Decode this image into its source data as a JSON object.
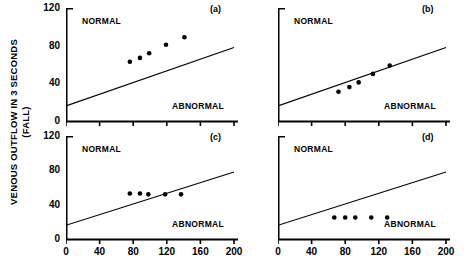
{
  "chart_data": {
    "type": "scatter",
    "title": "",
    "xlabel": "",
    "ylabel": "VENOUS OUTFLOW IN 3 SECONDS (FALL)",
    "ylabel_line1": "VENOUS OUTFLOW IN 3 SECONDS",
    "ylabel_line2": "(FALL)",
    "xlim": [
      0,
      200
    ],
    "ylim": [
      0,
      120
    ],
    "xticks": [
      0,
      40,
      80,
      120,
      160,
      200
    ],
    "yticks": [
      0,
      40,
      80,
      120
    ],
    "xtick_labels": [
      "0",
      "40",
      "80",
      "120",
      "160",
      "200"
    ],
    "ytick_labels": [
      "0",
      "40",
      "80",
      "120"
    ],
    "grid": false,
    "legend": "none",
    "zone_upper_label": "NORMAL",
    "zone_lower_label": "ABNORMAL",
    "reference_line": {
      "x": [
        0,
        200
      ],
      "y": [
        16,
        78
      ],
      "description": "diagonal boundary separating NORMAL from ABNORMAL"
    },
    "panels": [
      {
        "tag": "(a)",
        "zone_upper": "NORMAL",
        "zone_lower": "ABNORMAL",
        "x": [
          76,
          88,
          99,
          119,
          141
        ],
        "y": [
          63,
          67,
          72,
          81,
          89
        ]
      },
      {
        "tag": "(b)",
        "zone_upper": "NORMAL",
        "zone_lower": "ABNORMAL",
        "x": [
          72,
          85,
          96,
          113,
          133
        ],
        "y": [
          31,
          36,
          41,
          50,
          59
        ]
      },
      {
        "tag": "(c)",
        "zone_upper": "NORMAL",
        "zone_lower": "ABNORMAL",
        "x": [
          76,
          88,
          98,
          118,
          137
        ],
        "y": [
          53,
          53,
          52,
          52,
          52
        ]
      },
      {
        "tag": "(d)",
        "zone_upper": "NORMAL",
        "zone_lower": "ABNORMAL",
        "x": [
          67,
          80,
          92,
          111,
          130
        ],
        "y": [
          25,
          25,
          25,
          25,
          25
        ]
      }
    ],
    "marker_color": "#000000",
    "line_color": "#000000",
    "axis_color": "#000000",
    "background_color": "#ffffff"
  }
}
